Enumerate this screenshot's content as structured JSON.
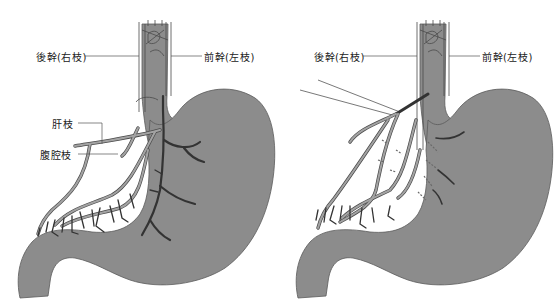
{
  "figure": {
    "panels": [
      {
        "id": "left",
        "labels": {
          "posterior_trunk": "後幹(右枝)",
          "anterior_trunk": "前幹(左枝)",
          "hepatic_branch": "肝枝",
          "celiac_branch": "腹腔枝"
        }
      },
      {
        "id": "right",
        "labels": {
          "posterior_trunk": "後幹(右枝)",
          "anterior_trunk": "前幹(左枝)"
        }
      }
    ],
    "colors": {
      "stomach": "#8c8c8c",
      "stomach_edge": "#5a5a5a",
      "nerve_light": "#a3a3a3",
      "nerve_outline": "#4a4a4a",
      "nerve_dark": "#333333",
      "leader_line": "#555555"
    }
  }
}
